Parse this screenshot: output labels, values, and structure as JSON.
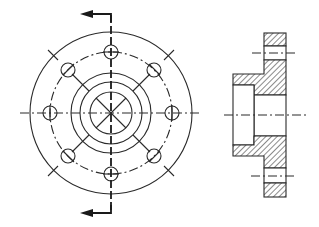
{
  "drawing": {
    "type": "engineering-drawing",
    "subject": "flange",
    "views": [
      {
        "name": "front-view",
        "description": "circular flange with 8 bolt holes"
      },
      {
        "name": "section-view",
        "description": "cross section A-A with hatching"
      }
    ],
    "colors": {
      "line": "#2a2a2a",
      "background": "#ffffff"
    }
  },
  "front_view": {
    "center": [
      111,
      113
    ],
    "outer_radius": 81,
    "bolt_circle_radius": 61,
    "hub_radii": [
      40,
      31,
      21
    ],
    "bolt_hole_radius": 7,
    "bolt_hole_count": 8
  },
  "section_view": {
    "flange_x": [
      264,
      286
    ],
    "flange_y": [
      33,
      197
    ],
    "hub_x": [
      233,
      264
    ],
    "hub_y": [
      74,
      156
    ],
    "bore_y": [
      95,
      136
    ],
    "centerline_y": 115
  }
}
